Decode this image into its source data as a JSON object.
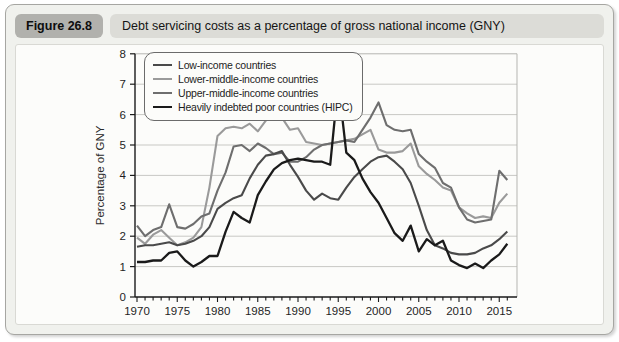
{
  "figure": {
    "badge": "Figure 26.8",
    "title": "Debt servicing costs as a percentage of gross national income (GNY)"
  },
  "chart_data": {
    "type": "line",
    "title": "Debt servicing costs as a percentage of gross national income (GNY)",
    "xlabel": "",
    "ylabel": "Percentage of GNY",
    "x_start": 1970,
    "x_end": 2016,
    "x_tick_interval": 5,
    "x_minor_tick_interval": 1,
    "x_tick_labels": [
      "1970",
      "1975",
      "1980",
      "1985",
      "1990",
      "1995",
      "2000",
      "2005",
      "2010",
      "2015"
    ],
    "ylim": [
      0,
      8
    ],
    "y_tick_interval": 1,
    "grid": "horizontal",
    "legend_position": "top-left",
    "axis_color": "#1a1a1a",
    "grid_color": "#c8c8c4",
    "series": [
      {
        "name": "Low-income countries",
        "color": "#4a4a4a",
        "values": [
          1.65,
          1.7,
          1.7,
          1.75,
          1.8,
          1.7,
          1.75,
          1.85,
          2.0,
          2.3,
          2.9,
          3.1,
          3.25,
          3.35,
          3.9,
          4.35,
          4.65,
          4.7,
          4.8,
          4.35,
          3.95,
          3.5,
          3.2,
          3.4,
          3.25,
          3.2,
          3.6,
          3.95,
          4.2,
          4.45,
          4.6,
          4.65,
          4.45,
          4.2,
          3.75,
          3.0,
          2.2,
          1.7,
          1.6,
          1.45,
          1.4,
          1.4,
          1.45,
          1.6,
          1.7,
          1.9,
          2.15
        ]
      },
      {
        "name": "Lower-middle-income countries",
        "color": "#9a9a9a",
        "values": [
          1.95,
          1.75,
          2.05,
          2.2,
          1.95,
          1.7,
          1.8,
          1.95,
          2.3,
          3.6,
          5.3,
          5.55,
          5.6,
          5.55,
          5.7,
          5.45,
          5.8,
          5.95,
          5.9,
          5.5,
          5.55,
          5.1,
          5.05,
          5.0,
          5.05,
          5.1,
          5.15,
          5.2,
          5.35,
          5.5,
          4.85,
          4.75,
          4.75,
          4.8,
          5.05,
          4.3,
          4.05,
          3.85,
          3.6,
          3.5,
          2.95,
          2.75,
          2.6,
          2.65,
          2.6,
          3.1,
          3.4
        ]
      },
      {
        "name": "Upper-middle-income countries",
        "color": "#6e6e6e",
        "values": [
          2.35,
          2.0,
          2.2,
          2.3,
          3.05,
          2.3,
          2.25,
          2.4,
          2.65,
          2.75,
          3.5,
          4.1,
          4.95,
          5.0,
          4.8,
          5.05,
          4.9,
          4.7,
          4.75,
          4.45,
          4.45,
          4.6,
          4.85,
          5.0,
          5.05,
          5.1,
          5.15,
          5.1,
          5.5,
          5.9,
          6.4,
          5.65,
          5.5,
          5.45,
          5.5,
          4.7,
          4.45,
          4.25,
          3.75,
          3.6,
          2.95,
          2.55,
          2.45,
          2.5,
          2.55,
          4.15,
          3.85
        ]
      },
      {
        "name": "Heavily indebted poor countries (HIPC)",
        "color": "#1a1a1a",
        "values": [
          1.15,
          1.15,
          1.2,
          1.2,
          1.45,
          1.5,
          1.2,
          1.0,
          1.15,
          1.35,
          1.35,
          2.15,
          2.8,
          2.6,
          2.45,
          3.35,
          3.8,
          4.2,
          4.4,
          4.5,
          4.55,
          4.5,
          4.45,
          4.45,
          4.35,
          7.05,
          4.75,
          4.5,
          3.9,
          3.45,
          3.1,
          2.6,
          2.1,
          1.85,
          2.35,
          1.5,
          1.9,
          1.7,
          1.85,
          1.2,
          1.05,
          0.95,
          1.1,
          0.95,
          1.2,
          1.4,
          1.75
        ]
      }
    ]
  }
}
